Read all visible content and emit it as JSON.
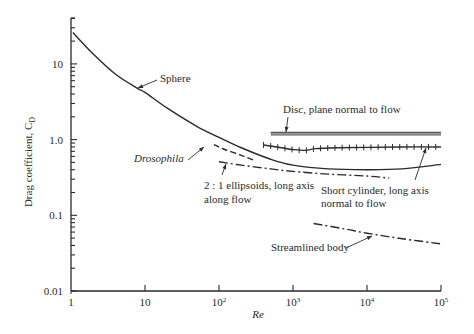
{
  "chart_data": {
    "type": "line",
    "title": "",
    "xlabel": "Re",
    "ylabel": "Drag coefficient, C",
    "ylabel_subscript": "D",
    "xscale": "log",
    "yscale": "log",
    "xlim": [
      1,
      100000
    ],
    "ylim": [
      0.01,
      40
    ],
    "grid": false,
    "legend": "none (inline annotations)",
    "x_ticks": [
      {
        "value": 1,
        "label": "1"
      },
      {
        "value": 10,
        "label": "10"
      },
      {
        "value": 100,
        "label": "10",
        "sup": "2"
      },
      {
        "value": 1000,
        "label": "10",
        "sup": "3"
      },
      {
        "value": 10000,
        "label": "10",
        "sup": "4"
      },
      {
        "value": 100000,
        "label": "10",
        "sup": "5"
      }
    ],
    "y_ticks": [
      {
        "value": 0.01,
        "label": "0.01"
      },
      {
        "value": 0.1,
        "label": "0.1"
      },
      {
        "value": 1,
        "label": "1.0"
      },
      {
        "value": 10,
        "label": "10"
      }
    ],
    "series": [
      {
        "name": "Sphere",
        "style": "solid",
        "x": [
          1.06,
          2,
          4,
          7.8,
          10,
          20,
          50,
          100,
          200,
          500,
          1000,
          3000,
          10000,
          30000,
          100000
        ],
        "y": [
          26,
          13.5,
          7.3,
          4.8,
          4.2,
          2.6,
          1.5,
          1.07,
          0.78,
          0.55,
          0.46,
          0.41,
          0.4,
          0.41,
          0.47
        ]
      },
      {
        "name": "Drosophila",
        "style": "dashed",
        "x": [
          85,
          120,
          200,
          300
        ],
        "y": [
          0.86,
          0.74,
          0.62,
          0.53
        ]
      },
      {
        "name": "2:1 ellipsoids, long axis along flow",
        "style": "dashdot",
        "x": [
          100,
          200,
          500,
          1000,
          3000,
          10000,
          20000
        ],
        "y": [
          0.51,
          0.46,
          0.41,
          0.38,
          0.35,
          0.33,
          0.31
        ]
      },
      {
        "name": "Short cylinder, long axis normal to flow",
        "style": "solid-with-ticks",
        "x": [
          400,
          700,
          1000,
          1500,
          2000,
          4000,
          10000,
          30000,
          100000
        ],
        "y": [
          0.85,
          0.78,
          0.74,
          0.72,
          0.76,
          0.78,
          0.79,
          0.8,
          0.8
        ]
      },
      {
        "name": "Disc, plane normal to flow",
        "style": "double-line",
        "x": [
          500,
          100000
        ],
        "y": [
          1.2,
          1.2
        ]
      },
      {
        "name": "Streamlined body",
        "style": "dashdot",
        "x": [
          1900,
          5000,
          10000,
          30000,
          100000
        ],
        "y": [
          0.078,
          0.066,
          0.058,
          0.049,
          0.042
        ]
      }
    ],
    "annotations": [
      {
        "text": "Sphere",
        "x": 160,
        "y": 82,
        "anchor": "start",
        "italic": false,
        "arrow": [
          [
            157,
            80
          ],
          [
            138,
            88
          ]
        ]
      },
      {
        "text": "Drosophila",
        "x": 134,
        "y": 162,
        "anchor": "start",
        "italic": true,
        "arrow": [
          [
            188,
            160
          ],
          [
            204,
            147
          ]
        ]
      },
      {
        "text": "2 : 1 ellipsoids, long axis",
        "x": 204,
        "y": 189,
        "anchor": "start",
        "italic": false,
        "arrow": [
          [
            222,
            175
          ],
          [
            226,
            164
          ]
        ]
      },
      {
        "text": "along flow",
        "x": 204,
        "y": 203,
        "anchor": "start",
        "italic": false
      },
      {
        "text": "Disc, plane normal to flow",
        "x": 283,
        "y": 113,
        "anchor": "start",
        "italic": false,
        "arrow": [
          [
            288,
            117
          ],
          [
            286,
            132
          ]
        ]
      },
      {
        "text": "Short cylinder, long axis",
        "x": 321,
        "y": 194,
        "anchor": "start",
        "italic": false,
        "arrow": [
          [
            415,
            180
          ],
          [
            426,
            148
          ]
        ]
      },
      {
        "text": "normal to flow",
        "x": 321,
        "y": 207,
        "anchor": "start",
        "italic": false
      },
      {
        "text": "Streamlined body",
        "x": 271,
        "y": 251,
        "anchor": "start",
        "italic": false,
        "arrow": [
          [
            346,
            248
          ],
          [
            372,
            236
          ]
        ]
      }
    ],
    "colors": {
      "ink": "#2a2a2a",
      "background": "#ffffff"
    }
  }
}
